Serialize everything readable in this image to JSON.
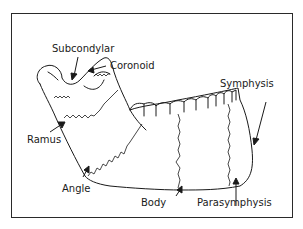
{
  "diagram": {
    "labels": {
      "subcondylar": "Subcondylar",
      "coronoid": "Coronoid",
      "symphysis": "Symphysis",
      "ramus": "Ramus",
      "angle": "Angle",
      "body": "Body",
      "parasymphysis": "Parasymphysis"
    },
    "colors": {
      "line": "#1a1a1a",
      "frame": "#2a2a2a",
      "background": "#ffffff"
    }
  }
}
